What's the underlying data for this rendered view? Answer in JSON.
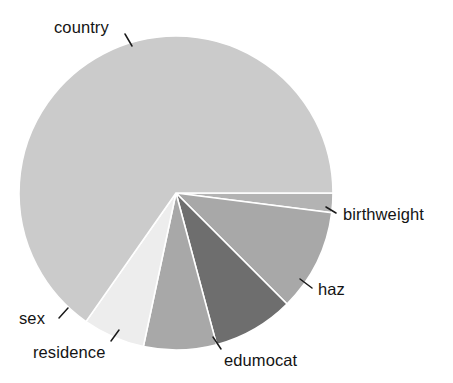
{
  "figure": {
    "background_color": "#ffffff",
    "width": 453,
    "height": 383
  },
  "chart_data": {
    "type": "pie",
    "title": "",
    "subtitle": "",
    "xlabel": "",
    "ylabel": "",
    "grid": false,
    "legend_position": "none",
    "label_placement": "outside-with-leader-lines",
    "start_angle_deg": 0,
    "direction": "clockwise",
    "center_px": [
      176,
      193
    ],
    "radius_px": 157,
    "labels": [
      "birthweight",
      "haz",
      "edumocat",
      "residence",
      "sex",
      "country"
    ],
    "values": [
      2.0,
      10.5,
      8.3,
      7.5,
      6.4,
      65.3
    ],
    "value_unit": "percent",
    "colors": [
      "#b3b3b3",
      "#a8a8a8",
      "#6e6e6e",
      "#a8a8a8",
      "#ededed",
      "#cbcbcb"
    ],
    "slices": [
      {
        "label": "birthweight",
        "value": 2.0,
        "color": "#b3b3b3",
        "start_angle_deg": 0,
        "end_angle_deg": 7.2,
        "label_x": 343,
        "label_y": 206,
        "leader": [
          336,
          213,
          326,
          207
        ]
      },
      {
        "label": "haz",
        "value": 10.5,
        "color": "#a8a8a8",
        "start_angle_deg": 7.2,
        "end_angle_deg": 45.0,
        "label_x": 318,
        "label_y": 281,
        "leader": [
          312,
          288,
          300,
          279
        ]
      },
      {
        "label": "edumocat",
        "value": 8.3,
        "color": "#6e6e6e",
        "start_angle_deg": 45.0,
        "end_angle_deg": 75.0,
        "label_x": 224,
        "label_y": 352,
        "leader": [
          221,
          349,
          213,
          337
        ]
      },
      {
        "label": "residence",
        "value": 7.5,
        "color": "#a8a8a8",
        "start_angle_deg": 75.0,
        "end_angle_deg": 102.0,
        "label_x": 33,
        "label_y": 344,
        "leader": [
          111,
          341,
          119,
          330
        ]
      },
      {
        "label": "sex",
        "value": 6.4,
        "color": "#ededed",
        "start_angle_deg": 102.0,
        "end_angle_deg": 125.0,
        "label_x": 19,
        "label_y": 310,
        "leader": [
          59,
          318,
          68,
          308
        ]
      },
      {
        "label": "country",
        "value": 65.3,
        "color": "#cbcbcb",
        "start_angle_deg": 125.0,
        "end_angle_deg": 360.0,
        "label_x": 54,
        "label_y": 19,
        "leader": [
          125,
          34,
          132,
          46
        ]
      }
    ],
    "slice_edge_color": "#ffffff",
    "slice_edge_width_px": 1.6
  }
}
